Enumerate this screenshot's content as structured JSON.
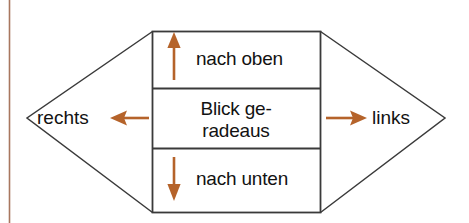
{
  "figure": {
    "type": "direction-diagram",
    "background_color": "#ffffff",
    "outline_color": "#3a3a3a",
    "arrow_color": "#b5632a",
    "text_color": "#121212",
    "margin_rule_color": "#a8775f"
  },
  "margin_rule": {
    "name": "left-margin-line",
    "x": 9,
    "color": "#a8775f"
  },
  "shape": {
    "left_tip_x": 27,
    "right_tip_x": 445,
    "center_y": 118,
    "box_left": 152,
    "box_right": 320,
    "box_top": 31,
    "box_bottom": 213,
    "divider_1_y": 88,
    "divider_2_y": 148
  },
  "cells": [
    {
      "id": "nach-oben",
      "label": "nach oben",
      "arrow": "arrow-up",
      "arrow_color": "#b5632a"
    },
    {
      "id": "blick-geradeaus",
      "label": "Blick ge-\nradeaus",
      "arrow": "none",
      "arrow_color": "#b5632a"
    },
    {
      "id": "nach-unten",
      "label": "nach unten",
      "arrow": "arrow-down",
      "arrow_color": "#b5632a"
    }
  ],
  "side_labels": {
    "left": {
      "id": "rechts",
      "label": "rechts",
      "arrow": "arrow-left",
      "arrow_color": "#b5632a"
    },
    "right": {
      "id": "links",
      "label": "links",
      "arrow": "arrow-right",
      "arrow_color": "#b5632a"
    }
  }
}
